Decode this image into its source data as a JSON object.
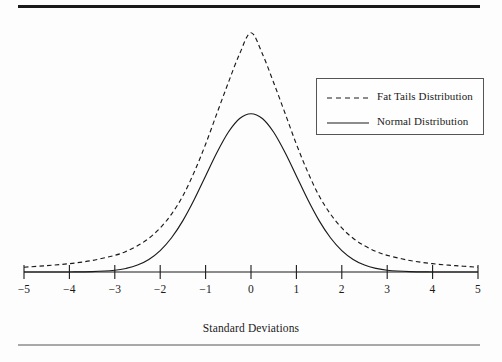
{
  "figure": {
    "background_color": "#fdfdfd",
    "line_color": "#1a1a1a",
    "top_rule_color": "#1a1a1a",
    "bottom_rule_color": "#a9a9a9"
  },
  "legend": {
    "position": "upper-right-inside",
    "entries": [
      {
        "label": "Fat Tails Distribution",
        "style": "dashed",
        "color": "#1a1a1a"
      },
      {
        "label": "Normal Distribution",
        "style": "solid",
        "color": "#1a1a1a"
      }
    ]
  },
  "chart_data": {
    "type": "line",
    "title": "",
    "subtitle": "",
    "xlabel": "Standard Deviations",
    "ylabel": "",
    "xlim": [
      -5,
      5
    ],
    "ylim": [
      0,
      0.63
    ],
    "grid": false,
    "legend_position": "upper right",
    "x_ticks": [
      -5,
      -4,
      -3,
      -2,
      -1,
      0,
      1,
      2,
      3,
      4,
      5
    ],
    "x_tick_labels": [
      "−5",
      "−4",
      "−3",
      "−2",
      "−1",
      "0",
      "1",
      "2",
      "3",
      "4",
      "5"
    ],
    "y_axis_visible": false,
    "annotations": [],
    "x": [
      -5,
      -4.5,
      -4,
      -3.5,
      -3,
      -2.75,
      -2.5,
      -2.25,
      -2,
      -1.75,
      -1.5,
      -1.25,
      -1,
      -0.75,
      -0.5,
      -0.25,
      0,
      0.25,
      0.5,
      0.75,
      1,
      1.25,
      1.5,
      1.75,
      2,
      2.25,
      2.5,
      2.75,
      3,
      3.5,
      4,
      4.5,
      5
    ],
    "series": [
      {
        "name": "Fat Tails Distribution",
        "style": "dashed",
        "color": "#1a1a1a",
        "description": "Leptokurtic: higher narrow peak at 0, thinner shoulders near ±1.5, heavier tails beyond ±3",
        "values": [
          0.012,
          0.016,
          0.021,
          0.029,
          0.042,
          0.052,
          0.066,
          0.085,
          0.111,
          0.146,
          0.192,
          0.252,
          0.322,
          0.4,
          0.477,
          0.55,
          0.603,
          0.55,
          0.477,
          0.4,
          0.322,
          0.252,
          0.192,
          0.146,
          0.111,
          0.085,
          0.066,
          0.052,
          0.042,
          0.029,
          0.021,
          0.016,
          0.012
        ]
      },
      {
        "name": "Normal Distribution",
        "style": "solid",
        "color": "#1a1a1a",
        "description": "Standard normal: lower broader peak at 0, fatter shoulders near ±1.5, tails vanish past ±3.5",
        "values": [
          0.0,
          0.0,
          0.0001,
          0.0009,
          0.0044,
          0.0091,
          0.0175,
          0.0317,
          0.054,
          0.0863,
          0.1295,
          0.1826,
          0.242,
          0.3011,
          0.3521,
          0.3867,
          0.3989,
          0.3867,
          0.3521,
          0.3011,
          0.242,
          0.1826,
          0.1295,
          0.0863,
          0.054,
          0.0317,
          0.0175,
          0.0091,
          0.0044,
          0.0009,
          0.0001,
          0.0,
          0.0
        ]
      }
    ]
  }
}
